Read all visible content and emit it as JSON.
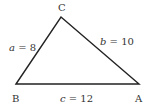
{
  "diagram": {
    "type": "triangle",
    "vertices": [
      {
        "name": "A",
        "label": "A",
        "x": 139,
        "y": 84
      },
      {
        "name": "B",
        "label": "B",
        "x": 16,
        "y": 84
      },
      {
        "name": "C",
        "label": "C",
        "x": 61,
        "y": 17
      }
    ],
    "sides": [
      {
        "name": "a",
        "var": "a",
        "eq": " = 8",
        "value": 8,
        "between": [
          "B",
          "C"
        ]
      },
      {
        "name": "b",
        "var": "b",
        "eq": " = 10",
        "value": 10,
        "between": [
          "C",
          "A"
        ]
      },
      {
        "name": "c",
        "var": "c",
        "eq": " = 12",
        "value": 12,
        "between": [
          "B",
          "A"
        ]
      }
    ],
    "stroke_color": "#222222"
  }
}
